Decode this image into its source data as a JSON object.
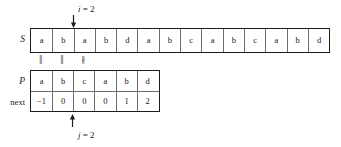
{
  "figure": {
    "background_color": "#ffffff",
    "line_color": "#1d1d1d",
    "grid_color": "#6e6e6e",
    "text_color": "#171717"
  },
  "rows": {
    "text_label": "S",
    "pattern_label": "P",
    "next_label": "next"
  },
  "text_string": {
    "name": "S",
    "cells": [
      "a",
      "b",
      "a",
      "b",
      "d",
      "a",
      "b",
      "c",
      "a",
      "b",
      "c",
      "a",
      "b",
      "d"
    ]
  },
  "pattern": {
    "name": "P",
    "cells": [
      "a",
      "b",
      "c",
      "a",
      "b",
      "d"
    ]
  },
  "next_array": {
    "name": "next",
    "cells": [
      "−1",
      "0",
      "0",
      "0",
      "1",
      "2"
    ]
  },
  "comparison_marks": {
    "marks": [
      "‖",
      "‖",
      "∦"
    ],
    "meaning": [
      "match",
      "match",
      "mismatch"
    ]
  },
  "pointers": {
    "i": {
      "label_var": "i",
      "label_eq": " = ",
      "label_value": "2",
      "full_label": "i = 2",
      "target_index": 2,
      "direction": "down",
      "icon": "arrow-down-icon"
    },
    "j": {
      "label_var": "j",
      "label_eq": " = ",
      "label_value": "2",
      "full_label": "j = 2",
      "target_index": 2,
      "direction": "up",
      "icon": "arrow-up-icon"
    }
  }
}
